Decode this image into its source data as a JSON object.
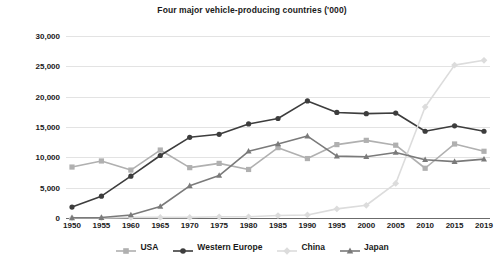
{
  "chart_data": {
    "type": "line",
    "title": "Four major vehicle-producing countries ('000)",
    "xlabel": "",
    "ylabel": "",
    "ylim": [
      0,
      30000
    ],
    "ytick_step": 5000,
    "grid": true,
    "legend_position": "bottom",
    "yticks": [
      "0",
      "5,000",
      "10,000",
      "15,000",
      "20,000",
      "25,000",
      "30,000"
    ],
    "ytick_values": [
      0,
      5000,
      10000,
      15000,
      20000,
      25000,
      30000
    ],
    "categories": [
      "1950",
      "1955",
      "1960",
      "1965",
      "1970",
      "1975",
      "1980",
      "1985",
      "1990",
      "1995",
      "2000",
      "2005",
      "2010",
      "2015",
      "2019"
    ],
    "x": [
      1950,
      1955,
      1960,
      1965,
      1970,
      1975,
      1980,
      1985,
      1990,
      1995,
      2000,
      2005,
      2010,
      2015,
      2019
    ],
    "series": [
      {
        "name": "USA",
        "color": "#b0b0b0",
        "marker": "square",
        "values": [
          8400,
          9400,
          7900,
          11200,
          8300,
          9000,
          8000,
          11600,
          9800,
          12100,
          12800,
          12000,
          8200,
          12200,
          11000
        ]
      },
      {
        "name": "Western Europe",
        "color": "#3d3d3d",
        "marker": "circle",
        "values": [
          1800,
          3600,
          6900,
          10300,
          13300,
          13800,
          15500,
          16400,
          19300,
          17400,
          17200,
          17300,
          14300,
          15200,
          14300
        ]
      },
      {
        "name": "China",
        "color": "#dcdcdc",
        "marker": "diamond",
        "values": [
          0,
          0,
          100,
          100,
          100,
          200,
          200,
          400,
          500,
          1500,
          2100,
          5700,
          18300,
          25200,
          26000
        ]
      },
      {
        "name": "Japan",
        "color": "#7a7a7a",
        "marker": "triangle",
        "values": [
          30,
          70,
          500,
          1900,
          5300,
          7000,
          11000,
          12200,
          13500,
          10200,
          10100,
          10800,
          9600,
          9300,
          9700
        ]
      }
    ]
  },
  "legend": {
    "items": [
      {
        "label": "USA"
      },
      {
        "label": "Western Europe"
      },
      {
        "label": "China"
      },
      {
        "label": "Japan"
      }
    ]
  }
}
